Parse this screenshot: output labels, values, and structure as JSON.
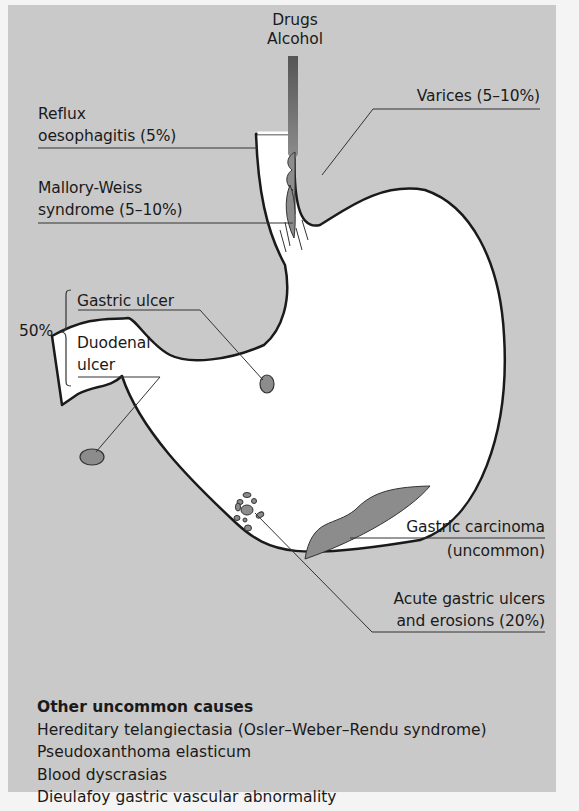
{
  "figure": {
    "labels": {
      "drugs": "Drugs",
      "alcohol": "Alcohol",
      "reflux_line1": "Reflux",
      "reflux_line2": "oesophagitis (5%)",
      "mallory_line1": "Mallory-Weiss",
      "mallory_line2": "syndrome (5–10%)",
      "varices": "Varices (5–10%)",
      "peptic_percent": "50%",
      "gastric_ulcer": "Gastric ulcer",
      "duodenal_line1": "Duodenal",
      "duodenal_line2": "ulcer",
      "carcinoma_line1": "Gastric carcinoma",
      "carcinoma_line2": "(uncommon)",
      "acute_line1": "Acute gastric ulcers",
      "acute_line2": "and erosions (20%)"
    },
    "other_causes": {
      "heading": "Other uncommon causes",
      "items": [
        "Hereditary telangiectasia (Osler–Weber–Rendu syndrome)",
        "Pseudoxanthoma elasticum",
        "Blood dyscrasias",
        "Dieulafoy gastric vascular abnormality"
      ]
    },
    "colors": {
      "panel_bg": "#c9c9c9",
      "organ_fill": "#ffffff",
      "lesion_fill": "#8c8c8c",
      "outline": "#1a1a1a"
    }
  }
}
